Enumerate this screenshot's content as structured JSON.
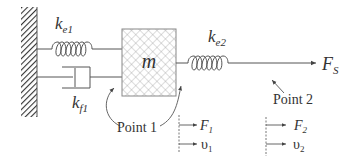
{
  "diagram": {
    "type": "mass-spring-damper system",
    "components": {
      "spring1": {
        "label_main": "k",
        "label_sub": "e1"
      },
      "damper": {
        "label_main": "k",
        "label_sub": "f1"
      },
      "spring2": {
        "label_main": "k",
        "label_sub": "e2"
      },
      "mass": {
        "label": "m"
      },
      "force_out": {
        "label_main": "F",
        "label_sub": "S"
      }
    },
    "points": [
      {
        "label": "Point 1"
      },
      {
        "label": "Point 2"
      }
    ],
    "indicators": [
      {
        "force_main": "F",
        "force_sub": "1",
        "vel_main": "υ",
        "vel_sub": "1"
      },
      {
        "force_main": "F",
        "force_sub": "2",
        "vel_main": "υ",
        "vel_sub": "2"
      }
    ],
    "colors": {
      "line": "#555555",
      "text": "#333333",
      "hatch": "#444444"
    }
  }
}
